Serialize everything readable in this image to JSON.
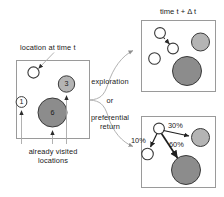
{
  "figure": {
    "kind": "exploration-and-preferential-return-diagram",
    "panels": {
      "current": {
        "name": "current-state-panel",
        "callout_top": "location at time t",
        "callout_bottom": "already visited\nlocations",
        "callout_bottom_line1": "already visited",
        "callout_bottom_line2": "locations",
        "visited_circles": [
          {
            "label": "1",
            "shade": "white"
          },
          {
            "label": "3",
            "shade": "light-gray"
          },
          {
            "label": "6",
            "shade": "dark-gray"
          }
        ],
        "current_location": {
          "label": "",
          "shade": "white"
        }
      },
      "exploration": {
        "name": "exploration-panel",
        "title": "time t + Δ t"
      },
      "preferential_return": {
        "name": "preferential-return-panel",
        "probabilities": [
          {
            "value": "30%",
            "target": "light-gray-circle"
          },
          {
            "value": "60%",
            "target": "dark-gray-circle"
          },
          {
            "value": "10%",
            "target": "white-circle"
          }
        ]
      }
    },
    "branch_labels": {
      "option_a": "exploration",
      "conjunction": "or",
      "option_b_line1": "preferential",
      "option_b_line2": "return"
    },
    "colors": {
      "white_fill": "#ffffff",
      "light_gray_fill": "#b4b4b4",
      "dark_gray_fill": "#8c8c8c",
      "stroke": "#3a3a3a",
      "panel_border": "#9a9a9a",
      "leader_line": "#a8a8a8",
      "text": "#1a1a1a"
    }
  }
}
